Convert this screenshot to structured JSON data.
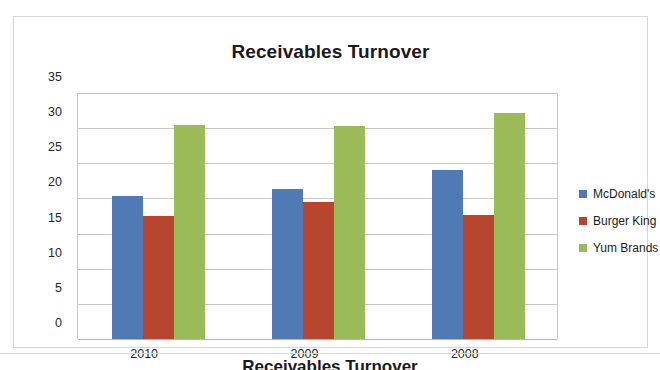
{
  "chart_data": {
    "type": "bar",
    "title": "Receivables Turnover",
    "xlabel": "",
    "ylabel": "",
    "categories": [
      "2010",
      "2009",
      "2008"
    ],
    "series": [
      {
        "name": "McDonald's",
        "color": "#4f7ab5",
        "values": [
          20.3,
          21.4,
          24.0
        ]
      },
      {
        "name": "Burger King",
        "color": "#b8462f",
        "values": [
          17.5,
          19.5,
          17.6
        ]
      },
      {
        "name": "Yum Brands",
        "color": "#9bbb59",
        "values": [
          30.4,
          30.3,
          32.2
        ]
      }
    ],
    "ylim": [
      0,
      35
    ],
    "ytick_step": 5,
    "yticks": [
      "35",
      "30",
      "25",
      "20",
      "15",
      "10",
      "5",
      "0"
    ],
    "grid": true,
    "legend_position": "right"
  },
  "bottom_caption": "Receivables Turnover"
}
